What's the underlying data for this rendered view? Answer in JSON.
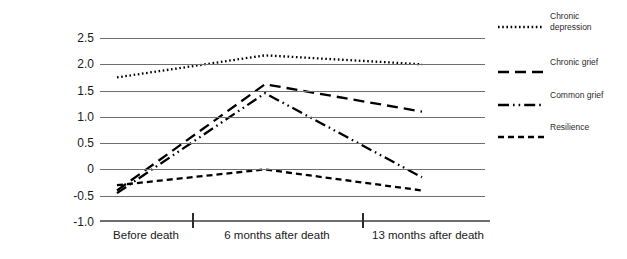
{
  "chart_data": {
    "type": "line",
    "title": "",
    "xlabel": "",
    "ylabel": "Depression Scale Score",
    "categories": [
      "Before death",
      "6 months after death",
      "13 months after death"
    ],
    "ylim": [
      -1.0,
      2.5
    ],
    "yticks": [
      "2.5",
      "2.0",
      "1.5",
      "1.0",
      "0.5",
      "0",
      "-0.5",
      "-1.0"
    ],
    "ytick_values": [
      2.5,
      2.0,
      1.5,
      1.0,
      0.5,
      0,
      -0.5,
      -1.0
    ],
    "grid": true,
    "legend_position": "right",
    "series": [
      {
        "name": "Chronic depression",
        "label_line1": "Chronic",
        "label_line2": "depression",
        "style": "dotted",
        "values": [
          1.75,
          2.17,
          2.0
        ]
      },
      {
        "name": "Chronic grief",
        "label_line1": "Chronic grief",
        "label_line2": "",
        "style": "long-dash",
        "values": [
          -0.4,
          1.62,
          1.1
        ]
      },
      {
        "name": "Common grief",
        "label_line1": "Common grief",
        "label_line2": "",
        "style": "dash-dot-dot",
        "values": [
          -0.45,
          1.45,
          -0.15
        ]
      },
      {
        "name": "Resilience",
        "label_line1": "Resilience",
        "label_line2": "",
        "style": "dashed",
        "values": [
          -0.3,
          0.0,
          -0.4
        ]
      }
    ],
    "colors": {
      "line": "#000000",
      "grid": "#6e6e6e",
      "text": "#1a1a1a",
      "background": "#ffffff"
    }
  }
}
